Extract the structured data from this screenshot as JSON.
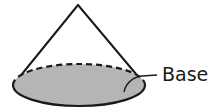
{
  "diagram": {
    "type": "cone",
    "label_base": "Base",
    "colors": {
      "stroke": "#1a1a1a",
      "base_fill": "#b5b5b5",
      "background": "#ffffff"
    },
    "geometry": {
      "apex": [
        78,
        5
      ],
      "base_center": [
        79,
        85
      ],
      "base_rx": 66,
      "base_ry": 21
    }
  }
}
